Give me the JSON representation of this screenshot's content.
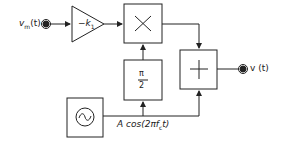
{
  "diagram": {
    "type": "block-diagram",
    "input": {
      "label_main": "v",
      "label_sub": "m",
      "label_arg": "(t)"
    },
    "gain_block": {
      "label_main": "−k",
      "label_sub": "1"
    },
    "multiplier_block": {
      "symbol": "×"
    },
    "phase_shift_block": {
      "numerator": "π",
      "denominator": "2"
    },
    "adder_block": {
      "symbol": "+"
    },
    "oscillator_block": {
      "symbol": "~"
    },
    "carrier_label": {
      "prefix": "A cos(2π",
      "f": "f",
      "sub": "c",
      "suffix": "t)"
    },
    "output": {
      "label": "v (t)"
    }
  },
  "colors": {
    "line": "#222222",
    "background": "#ffffff"
  }
}
